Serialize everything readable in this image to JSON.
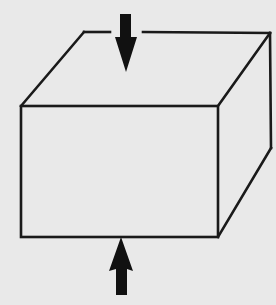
{
  "diagram": {
    "caption": "Rectangular block with opposing vertical forces applied on top and bottom faces",
    "colors": {
      "background": "#e9e9e9",
      "edge": "#1a1a1a",
      "arrow": "#111111"
    },
    "box": {
      "front_face": {
        "x1": 21,
        "y1": 106,
        "x2": 218,
        "y2": 237
      },
      "back_top_left": [
        84,
        32
      ],
      "back_top_right": [
        270,
        34
      ],
      "back_bottom_right": [
        271,
        148
      ]
    },
    "forces": [
      {
        "name": "top-force",
        "direction": "down",
        "tip": [
          126,
          72
        ]
      },
      {
        "name": "bottom-force",
        "direction": "up",
        "tip": [
          121,
          237
        ]
      }
    ]
  }
}
